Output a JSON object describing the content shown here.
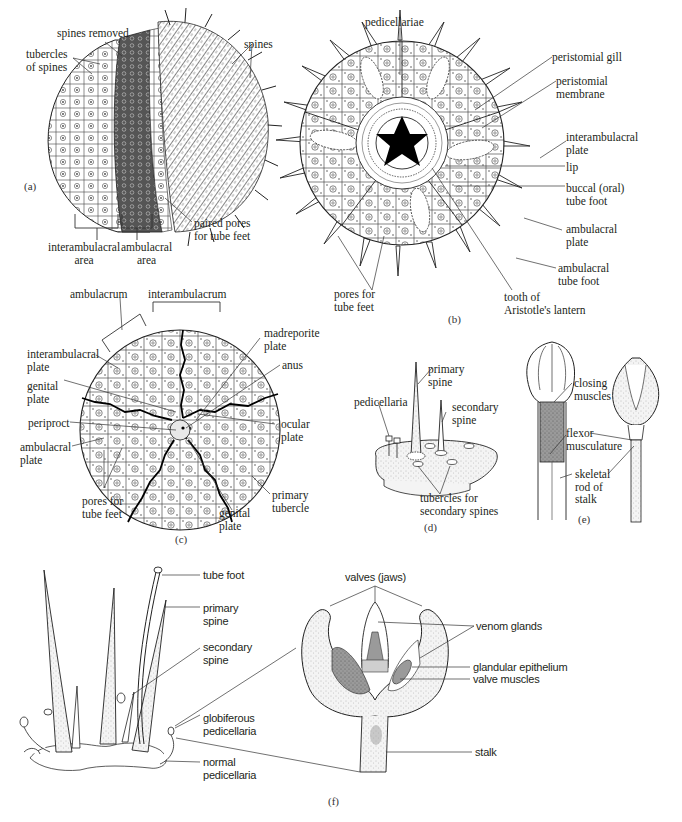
{
  "page_header": {
    "text": ""
  },
  "panels": {
    "a": {
      "tag": "(a)",
      "labels": {
        "spines_removed": "spines removed",
        "tubercles_of_spines": "tubercles\nof spines",
        "spines": "spines",
        "interambulacral_area": "interambulacral\narea",
        "ambulacral_area": "ambulacral\narea",
        "paired_pores": "paired pores\nfor tube feet"
      }
    },
    "b": {
      "tag": "(b)",
      "labels": {
        "pedicellariae": "pedicellariae",
        "peristomial_gill": "peristomial gill",
        "peristomial_membrane": "peristomial\nmembrane",
        "interambulacral_plate": "interambulacral\nplate",
        "lip": "lip",
        "buccal_tube_foot": "buccal (oral)\ntube foot",
        "ambulacral_plate": "ambulacral\nplate",
        "ambulacral_tube_foot": "ambulacral\ntube foot",
        "tooth": "tooth of\nAristotle's lantern",
        "pores_for_tube_feet": "pores for\ntube feet"
      }
    },
    "c": {
      "tag": "(c)",
      "labels": {
        "ambulacrum": "ambulacrum",
        "interambulacrum": "interambulacrum",
        "madreporite_plate": "madreporite\nplate",
        "interambulacral_plate": "interambulacral\nplate",
        "anus": "anus",
        "genital_plate_left": "genital\nplate",
        "periproct": "periproct",
        "ocular_plate": "ocular\nplate",
        "ambulacral_plate": "ambulacral\nplate",
        "pores_for_tube_feet": "pores for\ntube feet",
        "genital_plate_bottom": "genital\nplate",
        "primary_tubercle": "primary\ntubercle"
      }
    },
    "d": {
      "tag": "(d)",
      "labels": {
        "primary_spine": "primary\nspine",
        "pedicellaria": "pedicellaria",
        "secondary_spine": "secondary\nspine",
        "tubercles_secondary": "tubercles for\nsecondary spines"
      }
    },
    "e": {
      "tag": "(e)",
      "labels": {
        "closing_muscles": "closing\nmuscles",
        "flexor_musculature": "flexor\nmusculature",
        "skeletal_rod": "skeletal\nrod of\nstalk"
      }
    },
    "f": {
      "tag": "(f)",
      "labels": {
        "tube_foot": "tube foot",
        "primary_spine": "primary\nspine",
        "secondary_spine": "secondary\nspine",
        "globiferous_pedicellaria": "globiferous\npedicellaria",
        "normal_pedicellaria": "normal\npedicellaria",
        "valves_jaws": "valves (jaws)",
        "venom_glands": "venom glands",
        "glandular_epithelium": "glandular epithelium",
        "valve_muscles": "valve muscles",
        "stalk": "stalk"
      }
    }
  },
  "colors": {
    "ink": "#231f20",
    "stipple": "#bdbdbd",
    "dark_band": "#4a4a4a",
    "background": "#ffffff"
  }
}
